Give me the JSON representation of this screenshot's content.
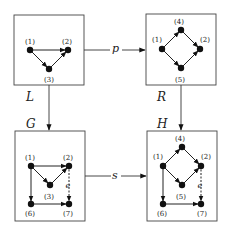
{
  "graphs": {
    "L": {
      "label": "L",
      "nodes": [
        {
          "id": "1",
          "label": "(1)"
        },
        {
          "id": "2",
          "label": "(2)"
        },
        {
          "id": "3",
          "label": "(3)"
        }
      ],
      "edges": [
        [
          "1",
          "2"
        ],
        [
          "1",
          "3"
        ],
        [
          "3",
          "2"
        ]
      ]
    },
    "R": {
      "label": "R",
      "nodes": [
        {
          "id": "1",
          "label": "(1)"
        },
        {
          "id": "2",
          "label": "(2)"
        },
        {
          "id": "4",
          "label": "(4)"
        },
        {
          "id": "5",
          "label": "(5)"
        }
      ],
      "edges": [
        [
          "1",
          "4"
        ],
        [
          "4",
          "2"
        ],
        [
          "1",
          "5"
        ],
        [
          "5",
          "2"
        ]
      ]
    },
    "G": {
      "label": "G",
      "nodes": [
        {
          "id": "1",
          "label": "(1)"
        },
        {
          "id": "2",
          "label": "(2)"
        },
        {
          "id": "3",
          "label": "(3)"
        },
        {
          "id": "6",
          "label": "(6)"
        },
        {
          "id": "7",
          "label": "(7)"
        }
      ],
      "edges": [
        [
          "1",
          "2"
        ],
        [
          "1",
          "3"
        ],
        [
          "3",
          "2"
        ],
        [
          "1",
          "6"
        ],
        [
          "6",
          "7"
        ],
        [
          "2",
          "7"
        ]
      ],
      "edge_label": "e"
    },
    "H": {
      "label": "H",
      "nodes": [
        {
          "id": "1",
          "label": "(1)"
        },
        {
          "id": "2",
          "label": "(2)"
        },
        {
          "id": "4",
          "label": "(4)"
        },
        {
          "id": "5",
          "label": "(5)"
        },
        {
          "id": "6",
          "label": "(6)"
        },
        {
          "id": "7",
          "label": "(7)"
        }
      ],
      "edges": [
        [
          "1",
          "4"
        ],
        [
          "4",
          "2"
        ],
        [
          "1",
          "5"
        ],
        [
          "5",
          "2"
        ],
        [
          "1",
          "6"
        ],
        [
          "6",
          "7"
        ],
        [
          "2",
          "7"
        ]
      ],
      "edge_label": "e"
    }
  },
  "morphisms": {
    "p": {
      "label": "p",
      "from": "L",
      "to": "R"
    },
    "s": {
      "label": "s",
      "from": "G",
      "to": "H"
    },
    "L_to_G": {
      "from": "L",
      "to": "G"
    },
    "R_to_H": {
      "from": "R",
      "to": "H"
    }
  }
}
